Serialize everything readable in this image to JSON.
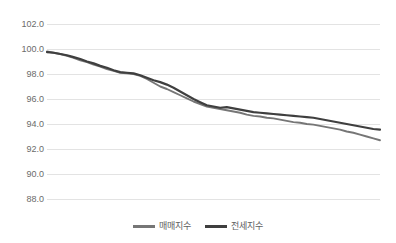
{
  "chart_data": {
    "type": "line",
    "title": "",
    "subtitle": "",
    "xlabel": "",
    "ylabel": "",
    "ylim": [
      88.0,
      102.0
    ],
    "ytick_labels": [
      "102.0",
      "100.0",
      "98.0",
      "96.0",
      "94.0",
      "92.0",
      "90.0",
      "88.0"
    ],
    "ytick_values": [
      102.0,
      100.0,
      98.0,
      96.0,
      94.0,
      92.0,
      90.0,
      88.0
    ],
    "xtick_labels": [],
    "grid": "horizontal",
    "legend_position": "bottom-center",
    "x": [
      0,
      1,
      2,
      3,
      4,
      5,
      6,
      7,
      8,
      9,
      10,
      11,
      12,
      13,
      14,
      15,
      16,
      17,
      18,
      19,
      20,
      21,
      22,
      23,
      24,
      25,
      26,
      27,
      28,
      29,
      30,
      31,
      32,
      33,
      34,
      35,
      36,
      37,
      38,
      39,
      40,
      41,
      42,
      43,
      44,
      45,
      46,
      47,
      48,
      49,
      50
    ],
    "series": [
      {
        "name": "매매지수",
        "color": "#767676",
        "values": [
          99.8,
          99.7,
          99.6,
          99.45,
          99.3,
          99.1,
          98.95,
          98.75,
          98.6,
          98.4,
          98.25,
          98.1,
          98.05,
          98.0,
          97.85,
          97.6,
          97.3,
          97.0,
          96.8,
          96.55,
          96.3,
          96.05,
          95.8,
          95.6,
          95.4,
          95.3,
          95.2,
          95.1,
          95.0,
          94.9,
          94.75,
          94.65,
          94.6,
          94.5,
          94.45,
          94.35,
          94.25,
          94.15,
          94.1,
          94.0,
          93.95,
          93.85,
          93.75,
          93.65,
          93.55,
          93.4,
          93.3,
          93.15,
          93.0,
          92.85,
          92.7
        ]
      },
      {
        "name": "전세지수",
        "color": "#3f3f3f",
        "values": [
          99.75,
          99.7,
          99.6,
          99.5,
          99.35,
          99.2,
          99.0,
          98.85,
          98.65,
          98.5,
          98.3,
          98.15,
          98.1,
          98.05,
          97.9,
          97.7,
          97.5,
          97.35,
          97.15,
          96.9,
          96.6,
          96.3,
          96.0,
          95.75,
          95.5,
          95.4,
          95.3,
          95.35,
          95.25,
          95.15,
          95.05,
          94.95,
          94.9,
          94.85,
          94.8,
          94.75,
          94.7,
          94.65,
          94.6,
          94.55,
          94.5,
          94.4,
          94.3,
          94.2,
          94.1,
          94.0,
          93.9,
          93.8,
          93.7,
          93.6,
          93.55
        ]
      }
    ]
  },
  "legend": {
    "items": [
      {
        "label": "매매지수",
        "color": "#767676"
      },
      {
        "label": "전세지수",
        "color": "#3f3f3f"
      }
    ]
  }
}
